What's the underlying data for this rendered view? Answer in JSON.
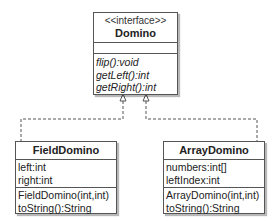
{
  "diagram": {
    "type": "uml-class-diagram",
    "interface": {
      "stereotype": "<<interface>>",
      "name": "Domino",
      "attributes": [],
      "operations": [
        "flip():void",
        "getLeft():int",
        "getRight():int"
      ]
    },
    "classes": [
      {
        "name": "FieldDomino",
        "attributes": [
          "left:int",
          "right:int"
        ],
        "operations": [
          "FieldDomino(int,int)",
          "toString():String"
        ]
      },
      {
        "name": "ArrayDomino",
        "attributes": [
          "numbers:int[]",
          "leftIndex:int"
        ],
        "operations": [
          "ArrayDomino(int,int)",
          "toString():String"
        ]
      }
    ],
    "relations": [
      {
        "from": "FieldDomino",
        "to": "Domino",
        "kind": "realization"
      },
      {
        "from": "ArrayDomino",
        "to": "Domino",
        "kind": "realization"
      }
    ]
  }
}
